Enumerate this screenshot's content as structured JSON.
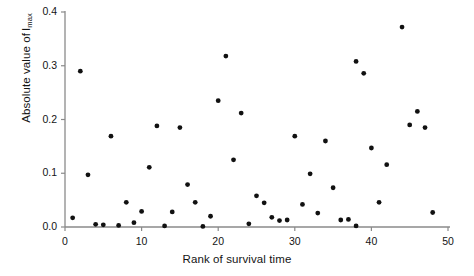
{
  "chart_data": {
    "type": "scatter",
    "title": "",
    "xlabel": "Rank of survival time",
    "ylabel": "Absolute value of I",
    "ylabel_subscript": "max",
    "xlim": [
      0,
      50
    ],
    "ylim": [
      0.0,
      0.4
    ],
    "xticks": [
      0,
      10,
      20,
      30,
      40,
      50
    ],
    "xtick_labels": [
      "0",
      "10",
      "20",
      "30",
      "40",
      "50"
    ],
    "yticks": [
      0.0,
      0.1,
      0.2,
      0.3,
      0.4
    ],
    "ytick_labels": [
      "0.0",
      "0.1",
      "0.2",
      "0.3",
      "0.4"
    ],
    "grid": false,
    "legend": null,
    "marker": {
      "shape": "circle",
      "color": "#111111",
      "size": 4
    },
    "series": [
      {
        "name": "Absolute value of Imax by rank of survival time",
        "x": [
          1,
          2,
          3,
          4,
          5,
          6,
          7,
          8,
          9,
          10,
          11,
          12,
          13,
          14,
          15,
          16,
          17,
          18,
          19,
          20,
          21,
          22,
          23,
          24,
          25,
          26,
          27,
          28,
          29,
          30,
          31,
          32,
          33,
          34,
          35,
          36,
          37,
          38,
          38,
          39,
          40,
          41,
          42,
          44,
          45,
          46,
          47,
          48
        ],
        "y": [
          0.017,
          0.29,
          0.097,
          0.005,
          0.004,
          0.169,
          0.003,
          0.046,
          0.008,
          0.029,
          0.111,
          0.188,
          0.002,
          0.028,
          0.185,
          0.079,
          0.046,
          0.001,
          0.02,
          0.235,
          0.318,
          0.125,
          0.212,
          0.006,
          0.058,
          0.045,
          0.018,
          0.012,
          0.013,
          0.169,
          0.042,
          0.099,
          0.026,
          0.16,
          0.073,
          0.013,
          0.014,
          0.308,
          0.002,
          0.286,
          0.147,
          0.046,
          0.116,
          0.372,
          0.19,
          0.215,
          0.185,
          0.027
        ]
      }
    ],
    "axis_color": "#8a8a8a",
    "background": "#ffffff"
  },
  "figure": {
    "ylabel_prefix": "Absolute value of",
    "ylabel_variable": "I",
    "ylabel_sub": "max",
    "xlabel_text": "Rank of survival time"
  }
}
